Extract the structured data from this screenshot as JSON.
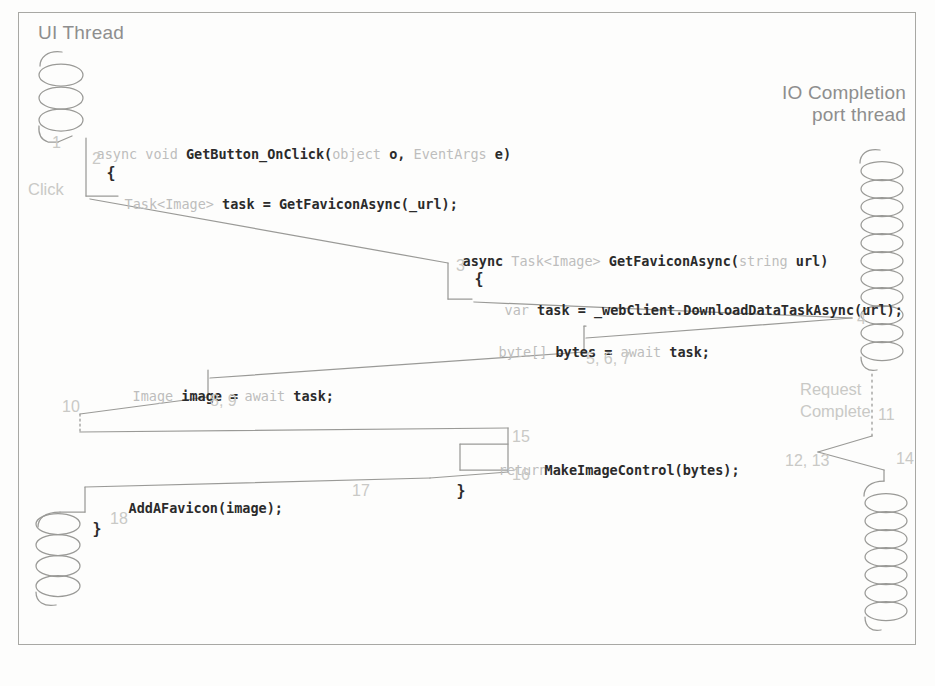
{
  "figure": {
    "kind": "async-await-execution-flow-diagram",
    "border_color": "#a8a8a4",
    "background": "#fdfdfc"
  },
  "threads": {
    "left": {
      "title": "UI Thread"
    },
    "right": {
      "title_line1": "IO Completion",
      "title_line2": "port thread"
    }
  },
  "colors": {
    "code_identifier": "#2b2b2b",
    "code_keyword": "#bdbdbd",
    "step_number": "#c9c9c6",
    "stroke": "#9a9a97"
  },
  "code_lines": [
    {
      "id": "line-getbutton-onclick",
      "parts": [
        {
          "text": "async void ",
          "style": "kw"
        },
        {
          "text": "GetButton_OnClick(",
          "style": "id"
        },
        {
          "text": "object ",
          "style": "kw"
        },
        {
          "text": "o, ",
          "style": "id"
        },
        {
          "text": "EventArgs ",
          "style": "kw"
        },
        {
          "text": "e)",
          "style": "id"
        }
      ]
    },
    {
      "id": "line-open-brace-1",
      "parts": [
        {
          "text": "{",
          "style": "brace"
        }
      ]
    },
    {
      "id": "line-task-getfaviconasync",
      "parts": [
        {
          "text": "Task<Image> ",
          "style": "kw"
        },
        {
          "text": "task = GetFaviconAsync(_url);",
          "style": "id"
        }
      ]
    },
    {
      "id": "line-getfaviconasync-signature",
      "parts": [
        {
          "text": "async ",
          "style": "id"
        },
        {
          "text": "Task<Image> ",
          "style": "kw"
        },
        {
          "text": "GetFaviconAsync(",
          "style": "id"
        },
        {
          "text": "string ",
          "style": "kw"
        },
        {
          "text": "url)",
          "style": "id"
        }
      ]
    },
    {
      "id": "line-open-brace-2",
      "parts": [
        {
          "text": "{",
          "style": "brace"
        }
      ]
    },
    {
      "id": "line-var-task-download",
      "parts": [
        {
          "text": "var ",
          "style": "kw"
        },
        {
          "text": "task = _webClient.DownloadDataTaskAsync(url);",
          "style": "id"
        }
      ]
    },
    {
      "id": "line-bytes-await",
      "parts": [
        {
          "text": "byte[] ",
          "style": "kw"
        },
        {
          "text": "bytes = ",
          "style": "id"
        }
      ],
      "boxed": [
        {
          "text": "await ",
          "style": "kw"
        },
        {
          "text": "task;",
          "style": "id"
        }
      ]
    },
    {
      "id": "line-image-await",
      "parts": [
        {
          "text": "Image ",
          "style": "kw"
        },
        {
          "text": "image = ",
          "style": "id"
        }
      ],
      "boxed": [
        {
          "text": "await ",
          "style": "kw"
        },
        {
          "text": "task;",
          "style": "id"
        }
      ]
    },
    {
      "id": "line-return-makeimagecontrol",
      "boxed_left": [
        {
          "text": "return",
          "style": "kw"
        }
      ],
      "parts": [
        {
          "text": "MakeImageControl(bytes);",
          "style": "id"
        }
      ]
    },
    {
      "id": "line-close-brace-1",
      "parts": [
        {
          "text": "}",
          "style": "brace"
        }
      ]
    },
    {
      "id": "line-addafavicon",
      "parts": [
        {
          "text": "AddAFavicon(image);",
          "style": "id"
        }
      ]
    },
    {
      "id": "line-close-brace-2",
      "parts": [
        {
          "text": "}",
          "style": "brace"
        }
      ]
    }
  ],
  "steps": [
    {
      "id": "step-1",
      "label": "1"
    },
    {
      "id": "step-2",
      "label": "2"
    },
    {
      "id": "step-3",
      "label": "3"
    },
    {
      "id": "step-4",
      "label": "4"
    },
    {
      "id": "step-567",
      "label": "5, 6, 7"
    },
    {
      "id": "step-89",
      "label": "8, 9"
    },
    {
      "id": "step-10",
      "label": "10"
    },
    {
      "id": "step-11",
      "label": "11"
    },
    {
      "id": "step-1213",
      "label": "12, 13"
    },
    {
      "id": "step-14",
      "label": "14"
    },
    {
      "id": "step-15",
      "label": "15"
    },
    {
      "id": "step-16",
      "label": "16"
    },
    {
      "id": "step-17",
      "label": "17"
    },
    {
      "id": "step-18",
      "label": "18"
    }
  ],
  "annotations": {
    "click": "Click",
    "request_complete_line1": "Request",
    "request_complete_line2": "Complete"
  }
}
